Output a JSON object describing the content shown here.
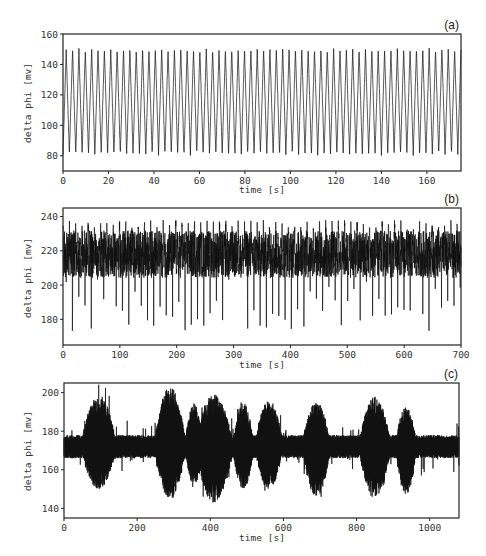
{
  "chart_data": [
    {
      "type": "line",
      "panel_label": "(a)",
      "title": "",
      "xlabel": "time [s]",
      "ylabel": "delta phi [mv]",
      "xlim": [
        0,
        175
      ],
      "ylim": [
        70,
        160
      ],
      "xticks": [
        0,
        20,
        40,
        60,
        80,
        100,
        120,
        140,
        160
      ],
      "yticks": [
        80,
        100,
        120,
        140,
        160
      ],
      "grid": false,
      "description": "Regular periodic oscillation, ~62 cycles over 175 s (period ~2.8 s)",
      "series": [
        {
          "name": "delta phi",
          "period_s": 2.8,
          "max": 150,
          "min": 81,
          "mean": 115
        }
      ]
    },
    {
      "type": "line",
      "panel_label": "(b)",
      "title": "",
      "xlabel": "time [s]",
      "ylabel": "delta phi [mv]",
      "xlim": [
        0,
        700
      ],
      "ylim": [
        165,
        245
      ],
      "xticks": [
        0,
        100,
        200,
        300,
        400,
        500,
        600,
        700
      ],
      "yticks": [
        180,
        200,
        220,
        240
      ],
      "grid": false,
      "description": "Irregular oscillation with dense band ~205-230 mV, spikes up to ~238 and down to ~173",
      "series": [
        {
          "name": "delta phi",
          "period_s": 11,
          "band_max": 230,
          "band_min": 207,
          "spike_max": 238,
          "spike_min": 173,
          "mean": 218
        }
      ]
    },
    {
      "type": "line",
      "panel_label": "(c)",
      "title": "",
      "xlabel": "time [s]",
      "ylabel": "delta phi [mv]",
      "xlim": [
        0,
        1080
      ],
      "ylim": [
        135,
        205
      ],
      "xticks": [
        0,
        200,
        400,
        600,
        800,
        1000
      ],
      "yticks": [
        140,
        160,
        180,
        200
      ],
      "grid": false,
      "description": "Bursting behaviour: quiescent band around 172 mV with intermittent high-amplitude bursts",
      "series": [
        {
          "name": "delta phi",
          "baseline": 172,
          "quiet_amplitude": 6,
          "bursts": [
            {
              "center": 95,
              "width": 50,
              "max": 199,
              "min": 150
            },
            {
              "center": 290,
              "width": 45,
              "max": 203,
              "min": 145
            },
            {
              "center": 355,
              "width": 25,
              "max": 195,
              "min": 152
            },
            {
              "center": 410,
              "width": 55,
              "max": 199,
              "min": 143
            },
            {
              "center": 490,
              "width": 30,
              "max": 195,
              "min": 150
            },
            {
              "center": 560,
              "width": 40,
              "max": 196,
              "min": 150
            },
            {
              "center": 690,
              "width": 40,
              "max": 195,
              "min": 146
            },
            {
              "center": 850,
              "width": 45,
              "max": 198,
              "min": 145
            },
            {
              "center": 935,
              "width": 30,
              "max": 193,
              "min": 147
            }
          ]
        }
      ]
    }
  ]
}
